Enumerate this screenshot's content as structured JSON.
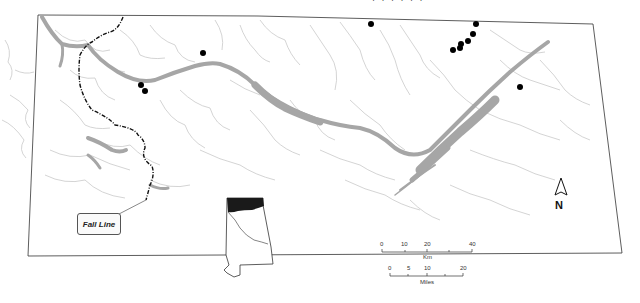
{
  "map": {
    "title_cut_off": "· ·  · ·  · ·",
    "region": "Northern Alabama (Tennessee River basin)",
    "colors": {
      "river": "#a6a6a6",
      "stream": "#c8c8c8",
      "border": "#333333",
      "fall_line": "#111111",
      "site_dot": "#000000",
      "inset_highlight": "#1a1a1a"
    },
    "fall_line_label": "Fall Line",
    "north_arrow": {
      "label": "N"
    },
    "scale_km": {
      "ticks": [
        "0",
        "10",
        "20",
        "40"
      ],
      "unit": "Km"
    },
    "scale_miles": {
      "ticks": [
        "0",
        "5",
        "10",
        "20"
      ],
      "unit": "Miles"
    },
    "inset": {
      "name": "Alabama state outline",
      "highlight": "northern region"
    },
    "sites": [
      {
        "x": 203,
        "y": 53
      },
      {
        "x": 141,
        "y": 85
      },
      {
        "x": 145,
        "y": 91
      },
      {
        "x": 371,
        "y": 24
      },
      {
        "x": 476,
        "y": 24
      },
      {
        "x": 473,
        "y": 34
      },
      {
        "x": 468,
        "y": 41
      },
      {
        "x": 461,
        "y": 44
      },
      {
        "x": 460,
        "y": 47
      },
      {
        "x": 453,
        "y": 50
      },
      {
        "x": 520,
        "y": 87
      }
    ]
  }
}
